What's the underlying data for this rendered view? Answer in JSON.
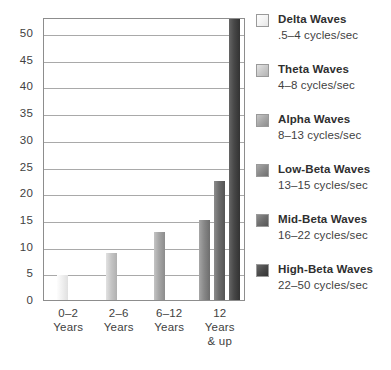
{
  "chart_data": {
    "type": "bar",
    "title": "",
    "subtitle": "",
    "xlabel": "",
    "ylabel": "",
    "ylim": [
      0,
      53
    ],
    "grid": true,
    "legend_position": "right",
    "categories": [
      "0–2 Years",
      "2–6 Years",
      "6–12 Years",
      "12 Years & up"
    ],
    "y_ticks": [
      "0",
      "5",
      "10",
      "15",
      "20",
      "25",
      "30",
      "35",
      "40",
      "45",
      "50"
    ],
    "y_tick_values": [
      0,
      5,
      10,
      15,
      20,
      25,
      30,
      35,
      40,
      45,
      50
    ],
    "series": [
      {
        "name": "Delta Waves",
        "range": ".5–4 cycles/sec",
        "color": "#f2f2f2",
        "color_light": "#fdfdfd",
        "color_dark": "#e2e2e2",
        "values": [
          4.6,
          null,
          null,
          null
        ]
      },
      {
        "name": "Theta Waves",
        "range": "4–8 cycles/sec",
        "color": "#c8c8c8",
        "color_light": "#e0e0e0",
        "color_dark": "#b2b2b2",
        "values": [
          null,
          8.8,
          null,
          null
        ]
      },
      {
        "name": "Alpha Waves",
        "range": "8–13 cycles/sec",
        "color": "#a8a8a8",
        "color_light": "#c2c2c2",
        "color_dark": "#8e8e8e",
        "values": [
          null,
          null,
          12.7,
          null
        ]
      },
      {
        "name": "Low-Beta Waves",
        "range": "13–15 cycles/sec",
        "color": "#8a8a8a",
        "color_light": "#a4a4a4",
        "color_dark": "#6f6f6f",
        "values": [
          null,
          null,
          null,
          15.0
        ]
      },
      {
        "name": "Mid-Beta Waves",
        "range": "16–22 cycles/sec",
        "color": "#6e6e6e",
        "color_light": "#8a8a8a",
        "color_dark": "#565656",
        "values": [
          null,
          null,
          null,
          22.3
        ]
      },
      {
        "name": "High-Beta Waves",
        "range": "22–50 cycles/sec",
        "color": "#4a4a4a",
        "color_light": "#646464",
        "color_dark": "#343434",
        "values": [
          null,
          null,
          null,
          53.0
        ]
      }
    ],
    "bars": [
      {
        "series": "Delta Waves",
        "category": "0–2 Years",
        "value": 4.6,
        "x": 13,
        "width": 11,
        "color_light": "#fdfdfd",
        "color": "#f0f0f0",
        "color_dark": "#e0e0e0"
      },
      {
        "series": "Theta Waves",
        "category": "2–6 Years",
        "value": 8.8,
        "x": 62,
        "width": 11,
        "color_light": "#e2e2e2",
        "color": "#c6c6c6",
        "color_dark": "#b0b0b0"
      },
      {
        "series": "Alpha Waves",
        "category": "6–12 Years",
        "value": 12.7,
        "x": 110,
        "width": 11,
        "color_light": "#c4c4c4",
        "color": "#a6a6a6",
        "color_dark": "#8c8c8c"
      },
      {
        "series": "Low-Beta Waves",
        "category": "12 Years & up",
        "value": 15.0,
        "x": 155,
        "width": 11,
        "color_light": "#a6a6a6",
        "color": "#888888",
        "color_dark": "#6d6d6d"
      },
      {
        "series": "Mid-Beta Waves",
        "category": "12 Years & up",
        "value": 22.3,
        "x": 170,
        "width": 11,
        "color_light": "#8c8c8c",
        "color": "#6c6c6c",
        "color_dark": "#545454"
      },
      {
        "series": "High-Beta Waves",
        "category": "12 Years & up",
        "value": 53.0,
        "x": 185,
        "width": 11,
        "color_light": "#666666",
        "color": "#484848",
        "color_dark": "#323232"
      }
    ]
  },
  "legend": {
    "items": [
      {
        "name": "Delta Waves",
        "range": ".5–4 cycles/sec",
        "swatch_light": "#fdfdfd",
        "swatch": "#f4f4f4",
        "swatch_dark": "#e6e6e6"
      },
      {
        "name": "Theta Waves",
        "range": "4–8 cycles/sec",
        "swatch_light": "#e4e4e4",
        "swatch": "#cacaca",
        "swatch_dark": "#b4b4b4"
      },
      {
        "name": "Alpha Waves",
        "range": "8–13 cycles/sec",
        "swatch_light": "#c6c6c6",
        "swatch": "#a8a8a8",
        "swatch_dark": "#8e8e8e"
      },
      {
        "name": "Low-Beta Waves",
        "range": "13–15 cycles/sec",
        "swatch_light": "#a8a8a8",
        "swatch": "#8a8a8a",
        "swatch_dark": "#6f6f6f"
      },
      {
        "name": "Mid-Beta Waves",
        "range": "16–22 cycles/sec",
        "swatch_light": "#8e8e8e",
        "swatch": "#6e6e6e",
        "swatch_dark": "#565656"
      },
      {
        "name": "High-Beta Waves",
        "range": "22–50 cycles/sec",
        "swatch_light": "#686868",
        "swatch": "#4a4a4a",
        "swatch_dark": "#343434"
      }
    ]
  },
  "axis": {
    "x_labels": [
      {
        "line1": "0–2",
        "line2": "Years",
        "line3": ""
      },
      {
        "line1": "2–6",
        "line2": "Years",
        "line3": ""
      },
      {
        "line1": "6–12",
        "line2": "Years",
        "line3": ""
      },
      {
        "line1": "12",
        "line2": "Years",
        "line3": "& up"
      }
    ]
  }
}
